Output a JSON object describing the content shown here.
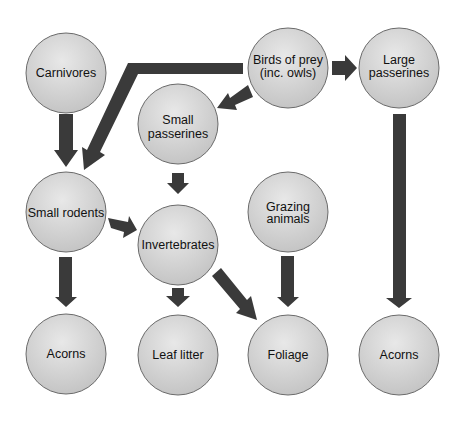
{
  "diagram": {
    "type": "food-web",
    "colors": {
      "node_fill_light": "#e6e6e6",
      "node_fill_dark": "#c4c4c4",
      "node_stroke": "#6a6a6a",
      "arrow": "#3a3a3a",
      "background": "#ffffff"
    },
    "nodes": [
      {
        "id": "carnivores",
        "lines": [
          "Carnivores"
        ],
        "cx": 66,
        "cy": 73
      },
      {
        "id": "birds-of-prey",
        "lines": [
          "Birds of prey",
          "(inc. owls)"
        ],
        "cx": 288,
        "cy": 68
      },
      {
        "id": "large-passerines",
        "lines": [
          "Large",
          "passerines"
        ],
        "cx": 399,
        "cy": 68
      },
      {
        "id": "small-passerines",
        "lines": [
          "Small",
          "passerines"
        ],
        "cx": 178,
        "cy": 124
      },
      {
        "id": "small-rodents",
        "lines": [
          "Small rodents"
        ],
        "cx": 66,
        "cy": 212
      },
      {
        "id": "invertebrates",
        "lines": [
          "Invertebrates"
        ],
        "cx": 178,
        "cy": 245
      },
      {
        "id": "grazing-animals",
        "lines": [
          "Grazing",
          "animals"
        ],
        "cx": 288,
        "cy": 212
      },
      {
        "id": "acorns-1",
        "lines": [
          "Acorns"
        ],
        "cx": 66,
        "cy": 354
      },
      {
        "id": "leaf-litter",
        "lines": [
          "Leaf litter"
        ],
        "cx": 178,
        "cy": 355
      },
      {
        "id": "foliage",
        "lines": [
          "Foliage"
        ],
        "cx": 288,
        "cy": 355
      },
      {
        "id": "acorns-2",
        "lines": [
          "Acorns"
        ],
        "cx": 399,
        "cy": 355
      }
    ],
    "edges": [
      {
        "from": "carnivores",
        "to": "small-rodents"
      },
      {
        "from": "birds-of-prey",
        "to": "small-rodents"
      },
      {
        "from": "birds-of-prey",
        "to": "small-passerines"
      },
      {
        "from": "birds-of-prey",
        "to": "large-passerines"
      },
      {
        "from": "small-passerines",
        "to": "invertebrates"
      },
      {
        "from": "small-rodents",
        "to": "invertebrates"
      },
      {
        "from": "small-rodents",
        "to": "acorns-1"
      },
      {
        "from": "invertebrates",
        "to": "leaf-litter"
      },
      {
        "from": "invertebrates",
        "to": "foliage"
      },
      {
        "from": "grazing-animals",
        "to": "foliage"
      },
      {
        "from": "large-passerines",
        "to": "acorns-2"
      }
    ]
  }
}
